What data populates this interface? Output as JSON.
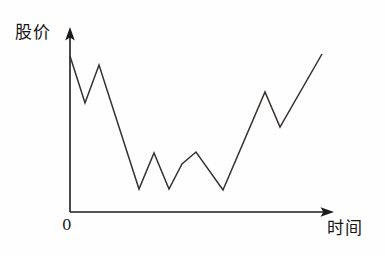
{
  "figure": {
    "background_color": "#fefefe",
    "line_color": "#35312f",
    "axis_color": "#1c1c1c",
    "y_axis_label": "股价",
    "x_axis_label": "时间",
    "origin_label": "0"
  },
  "chart_data": {
    "type": "line",
    "title": "",
    "subtitle": "",
    "xlabel": "时间",
    "ylabel": "股价",
    "grid": false,
    "legend": null,
    "axis_style": "arrow",
    "origin_label": "0",
    "tick_labels": {
      "x": [],
      "y": []
    },
    "xlim": [
      0,
      13
    ],
    "ylim": [
      0,
      10
    ],
    "annotations": [],
    "series": [
      {
        "name": "股价",
        "color": "#35312f",
        "x": [
          0,
          0.6,
          1.2,
          2.8,
          3.4,
          4.6,
          5.6,
          6.6,
          7.8,
          9.5,
          10.1,
          11.9
        ],
        "y": [
          9.0,
          6.1,
          8.6,
          0.9,
          3.1,
          0.9,
          3.1,
          3.2,
          0.8,
          6.9,
          4.6,
          9.1
        ],
        "points_pixel": [
          [
            70,
            56
          ],
          [
            85,
            103
          ],
          [
            99,
            65
          ],
          [
            139,
            189
          ],
          [
            154,
            153
          ],
          [
            169,
            189
          ],
          [
            182,
            164
          ],
          [
            196,
            152
          ],
          [
            223,
            190
          ],
          [
            265,
            92
          ],
          [
            280,
            127
          ],
          [
            322,
            54
          ]
        ]
      }
    ]
  }
}
